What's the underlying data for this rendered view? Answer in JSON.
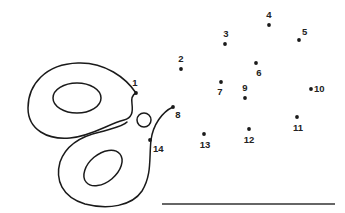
{
  "puzzle": {
    "type": "connect-the-dots",
    "ink_color": "#1a1a1a",
    "background": "#ffffff",
    "dots": [
      {
        "n": "1",
        "x": 136,
        "y": 93,
        "lx": 135,
        "ly": 86,
        "anchor": "middle"
      },
      {
        "n": "2",
        "x": 181,
        "y": 69,
        "lx": 181,
        "ly": 62,
        "anchor": "middle"
      },
      {
        "n": "3",
        "x": 225,
        "y": 44,
        "lx": 226,
        "ly": 37,
        "anchor": "middle"
      },
      {
        "n": "4",
        "x": 269,
        "y": 25,
        "lx": 269,
        "ly": 18,
        "anchor": "middle"
      },
      {
        "n": "5",
        "x": 299,
        "y": 40,
        "lx": 302,
        "ly": 35,
        "anchor": "start"
      },
      {
        "n": "6",
        "x": 256,
        "y": 63,
        "lx": 259,
        "ly": 76,
        "anchor": "middle"
      },
      {
        "n": "7",
        "x": 221,
        "y": 82,
        "lx": 220,
        "ly": 95,
        "anchor": "middle"
      },
      {
        "n": "8",
        "x": 173,
        "y": 107,
        "lx": 178,
        "ly": 118,
        "anchor": "middle"
      },
      {
        "n": "9",
        "x": 245,
        "y": 98,
        "lx": 245,
        "ly": 91,
        "anchor": "middle"
      },
      {
        "n": "10",
        "x": 311,
        "y": 89,
        "lx": 314,
        "ly": 92,
        "anchor": "start"
      },
      {
        "n": "11",
        "x": 297,
        "y": 117,
        "lx": 298,
        "ly": 131,
        "anchor": "middle"
      },
      {
        "n": "12",
        "x": 249,
        "y": 129,
        "lx": 249,
        "ly": 143,
        "anchor": "middle"
      },
      {
        "n": "13",
        "x": 204,
        "y": 134,
        "lx": 205,
        "ly": 148,
        "anchor": "middle"
      },
      {
        "n": "14",
        "x": 150,
        "y": 140,
        "lx": 153,
        "ly": 152,
        "anchor": "start"
      }
    ],
    "answer_line": {
      "x1": 162,
      "y1": 204,
      "x2": 335,
      "y2": 204
    }
  }
}
